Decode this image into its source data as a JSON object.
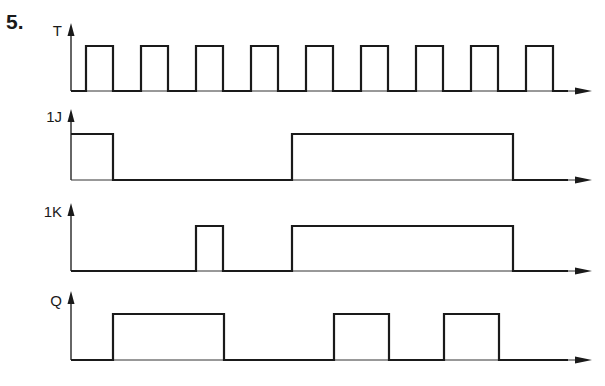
{
  "problem_number": "5.",
  "signals": [
    {
      "name": "T",
      "label_y": 22,
      "base_y": 91,
      "high_y": 46,
      "axis_top": 26,
      "transitions": [
        [
          71,
          0
        ],
        [
          86,
          1
        ],
        [
          113,
          0
        ],
        [
          141,
          1
        ],
        [
          168,
          0
        ],
        [
          196,
          1
        ],
        [
          223,
          0
        ],
        [
          251,
          1
        ],
        [
          278,
          0
        ],
        [
          306,
          1
        ],
        [
          333,
          0
        ],
        [
          361,
          1
        ],
        [
          388,
          0
        ],
        [
          416,
          1
        ],
        [
          443,
          0
        ],
        [
          471,
          1
        ],
        [
          498,
          0
        ],
        [
          526,
          1
        ],
        [
          553,
          0
        ],
        [
          568,
          0
        ]
      ]
    },
    {
      "name": "1J",
      "label_y": 108,
      "base_y": 180,
      "high_y": 134,
      "axis_top": 112,
      "transitions": [
        [
          71,
          1
        ],
        [
          113,
          0
        ],
        [
          292,
          1
        ],
        [
          513,
          0
        ],
        [
          568,
          0
        ]
      ]
    },
    {
      "name": "1K",
      "label_y": 203,
      "base_y": 271,
      "high_y": 226,
      "axis_top": 206,
      "transitions": [
        [
          71,
          0
        ],
        [
          196,
          1
        ],
        [
          223,
          0
        ],
        [
          292,
          1
        ],
        [
          513,
          0
        ],
        [
          568,
          0
        ]
      ]
    },
    {
      "name": "Q",
      "label_y": 292,
      "base_y": 360,
      "high_y": 314,
      "axis_top": 294,
      "transitions": [
        [
          71,
          0
        ],
        [
          113,
          1
        ],
        [
          224,
          0
        ],
        [
          334,
          1
        ],
        [
          389,
          0
        ],
        [
          444,
          1
        ],
        [
          499,
          0
        ],
        [
          568,
          0
        ]
      ]
    }
  ],
  "style": {
    "line_color": "#1a1a1a",
    "axis_color": "#333333"
  }
}
